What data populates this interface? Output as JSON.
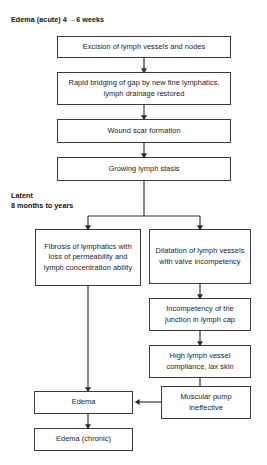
{
  "diagram": {
    "line_color": "#3a3a3a",
    "text_color": "#1a1a1a",
    "background": "#ffffff"
  },
  "stage_labels": [
    {
      "id": "acute",
      "text": "Edema (acute) 4 →6 weeks"
    },
    {
      "id": "latent",
      "text": "Latent\n8 months to years"
    }
  ],
  "nodes": [
    {
      "id": "excision",
      "text": "Excision of lymph vessels and nodes"
    },
    {
      "id": "bridging",
      "text": "Rapid bridging of gap by new fine lymphatics, lymph drainage restored"
    },
    {
      "id": "scar",
      "text": "Wound scar formation"
    },
    {
      "id": "stasis",
      "text": "Growing lymph stasis"
    },
    {
      "id": "fibrosis",
      "text": "Fibrosis of lymphatics with loss of permeability and lymph concentration ability"
    },
    {
      "id": "dilatation",
      "text": "Dilatation of lymph vessels with valve incompetency"
    },
    {
      "id": "junction",
      "text": "Incompetency of the junction in lymph cap"
    },
    {
      "id": "compliance",
      "text": "High lymph vessel compliance, lax skin"
    },
    {
      "id": "pump",
      "text": "Muscular pump ineffective"
    },
    {
      "id": "edema",
      "text": "Edema"
    },
    {
      "id": "edema-chronic",
      "text": "Edema (chronic)"
    }
  ]
}
